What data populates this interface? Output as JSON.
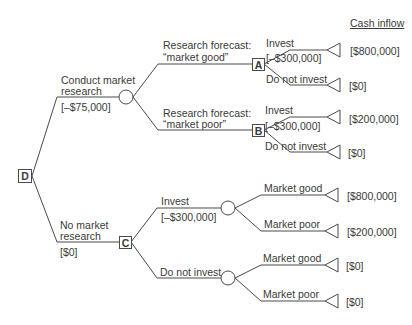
{
  "header": {
    "cash_inflow": "Cash inflow"
  },
  "nodes": {
    "D": "D",
    "A": "A",
    "B": "B",
    "C": "C"
  },
  "branches": {
    "conduct": {
      "line1": "Conduct market",
      "line2": "research",
      "cost": "[–$75,000]"
    },
    "no_research": {
      "line1": "No market",
      "line2": "research",
      "cost": "[$0]"
    },
    "forecast_good": {
      "line1": "Research forecast:",
      "line2": "“market good”"
    },
    "forecast_poor": {
      "line1": "Research forecast:",
      "line2": "“market poor”"
    },
    "a_invest": {
      "label": "Invest",
      "cost": "[–$300,000]"
    },
    "a_not": {
      "label": "Do not invest"
    },
    "b_invest": {
      "label": "Invest",
      "cost": "[–$300,000]"
    },
    "b_not": {
      "label": "Do not invest"
    },
    "c_invest": {
      "label": "Invest",
      "cost": "[–$300,000]"
    },
    "c_not": {
      "label": "Do not invest"
    },
    "ci_good": {
      "label": "Market good"
    },
    "ci_poor": {
      "label": "Market poor"
    },
    "cn_good": {
      "label": "Market good"
    },
    "cn_poor": {
      "label": "Market poor"
    }
  },
  "payoffs": [
    "[$800,000]",
    "[$0]",
    "[$200,000]",
    "[$0]",
    "[$800,000]",
    "[$200,000]",
    "[$0]",
    "[$0]"
  ]
}
